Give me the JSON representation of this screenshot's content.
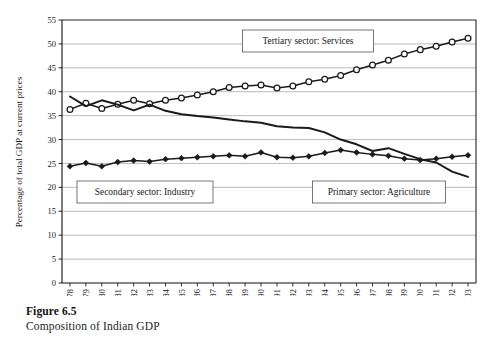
{
  "figure": {
    "number": "Figure 6.5",
    "caption": "Composition of Indian GDP"
  },
  "chart_data": {
    "type": "line",
    "title": "",
    "xlabel": "",
    "ylabel": "Percentage of total GDP at current prices",
    "ylim": [
      0,
      55
    ],
    "ytick_step": 5,
    "yticks": [
      "0",
      "5",
      "10",
      "15",
      "20",
      "25",
      "30",
      "35",
      "40",
      "45",
      "50",
      "55"
    ],
    "grid": true,
    "grid_axis": "y",
    "legend": "inline-annotations",
    "categories": [
      "1978",
      "1979",
      "1980",
      "1981",
      "1982",
      "1983",
      "1984",
      "1985",
      "1986",
      "1987",
      "1988",
      "1989",
      "1990",
      "1991",
      "1992",
      "1993",
      "1994",
      "1995",
      "1996",
      "1997",
      "1998",
      "1999",
      "2000",
      "2001",
      "2002",
      "2003"
    ],
    "series": [
      {
        "name": "Tertiary sector: Services",
        "marker": "open-circle",
        "color": "#1a1a1a",
        "values": [
          36.3,
          37.6,
          36.5,
          37.4,
          38.2,
          37.5,
          38.2,
          38.7,
          39.3,
          40.0,
          40.9,
          41.2,
          41.4,
          40.8,
          41.2,
          42.1,
          42.6,
          43.4,
          44.6,
          45.6,
          46.6,
          47.9,
          48.8,
          49.5,
          50.4,
          51.2
        ]
      },
      {
        "name": "Primary sector: Agriculture",
        "marker": "none",
        "color": "#1a1a1a",
        "values": [
          39.0,
          37.0,
          38.2,
          37.3,
          36.1,
          37.3,
          36.0,
          35.3,
          34.9,
          34.6,
          34.2,
          33.8,
          33.5,
          32.8,
          32.5,
          32.4,
          31.5,
          30.0,
          29.0,
          27.6,
          28.2,
          27.0,
          25.9,
          25.2,
          23.3,
          22.2
        ]
      },
      {
        "name": "Secondary sector: Industry",
        "marker": "filled-diamond",
        "color": "#1a1a1a",
        "values": [
          24.4,
          25.1,
          24.4,
          25.3,
          25.6,
          25.4,
          25.9,
          26.1,
          26.3,
          26.5,
          26.7,
          26.5,
          27.3,
          26.3,
          26.2,
          26.5,
          27.2,
          27.8,
          27.3,
          26.9,
          26.6,
          26.0,
          25.7,
          26.0,
          26.4,
          26.7
        ]
      }
    ],
    "annotations": [
      {
        "label": "Tertiary sector: Services"
      },
      {
        "label": "Secondary sector: Industry"
      },
      {
        "label": "Primary sector: Agriculture"
      }
    ]
  }
}
